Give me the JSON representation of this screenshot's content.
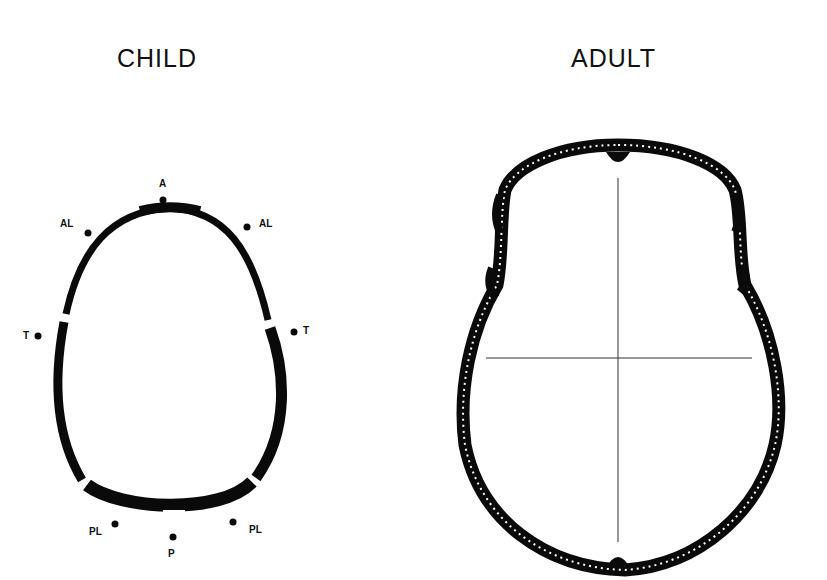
{
  "titles": {
    "child": "CHILD",
    "adult": "ADULT"
  },
  "child_labels": {
    "a": "A",
    "al_left": "AL",
    "al_right": "AL",
    "t_left": "T",
    "t_right": "T",
    "pl_left": "PL",
    "pl_right": "PL",
    "p": "P"
  },
  "colors": {
    "bone": "#0a0a0a",
    "background": "#ffffff"
  }
}
